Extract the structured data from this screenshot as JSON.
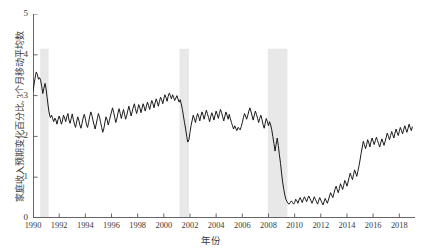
{
  "chart_data": {
    "type": "line",
    "title": "",
    "xlabel": "年份",
    "ylabel": "家庭收入预期变化百分比, 3个月移动平均数",
    "xlim": [
      1990.0,
      2019.2
    ],
    "ylim": [
      0,
      5
    ],
    "yticks": [
      0,
      1,
      2,
      3,
      4,
      5
    ],
    "xticks": [
      1990,
      1992,
      1994,
      1996,
      1998,
      2000,
      2002,
      2004,
      2006,
      2008,
      2010,
      2012,
      2014,
      2016,
      2018
    ],
    "xtick_labels": [
      "1990",
      "1992",
      "1994",
      "1996",
      "1998",
      "2000",
      "2002",
      "2004",
      "2006",
      "2008",
      "2010",
      "2012",
      "2014",
      "2016",
      "2018"
    ],
    "ytick_labels": [
      "0",
      "1",
      "2",
      "3",
      "4",
      "5"
    ],
    "grid": false,
    "legend": "none",
    "line_color": "#1a1a1a",
    "line_width": 1.0,
    "shading_color": "#e8e8e8",
    "axis_color": "#555555",
    "recession_bands": [
      {
        "name": "1990-1991 recession",
        "start": 1990.55,
        "end": 1991.2,
        "top": 4.15
      },
      {
        "name": "2001 recession",
        "start": 2001.2,
        "end": 2001.92,
        "top": 4.15
      },
      {
        "name": "2007-2009 recession",
        "start": 2007.95,
        "end": 2009.45,
        "top": 4.15
      }
    ],
    "series": [
      {
        "name": "家庭收入预期变化百分比(3个月移动平均)",
        "x": [
          1990.0,
          1990.08,
          1990.17,
          1990.25,
          1990.33,
          1990.42,
          1990.5,
          1990.58,
          1990.67,
          1990.75,
          1990.83,
          1990.92,
          1991.0,
          1991.08,
          1991.17,
          1991.25,
          1991.33,
          1991.42,
          1991.5,
          1991.58,
          1991.67,
          1991.75,
          1991.83,
          1991.92,
          1992.0,
          1992.08,
          1992.17,
          1992.25,
          1992.33,
          1992.42,
          1992.5,
          1992.58,
          1992.67,
          1992.75,
          1992.83,
          1992.92,
          1993.0,
          1993.08,
          1993.17,
          1993.25,
          1993.33,
          1993.42,
          1993.5,
          1993.58,
          1993.67,
          1993.75,
          1993.83,
          1993.92,
          1994.0,
          1994.08,
          1994.17,
          1994.25,
          1994.33,
          1994.42,
          1994.5,
          1994.58,
          1994.67,
          1994.75,
          1994.83,
          1994.92,
          1995.0,
          1995.08,
          1995.17,
          1995.25,
          1995.33,
          1995.42,
          1995.5,
          1995.58,
          1995.67,
          1995.75,
          1995.83,
          1995.92,
          1996.0,
          1996.08,
          1996.17,
          1996.25,
          1996.33,
          1996.42,
          1996.5,
          1996.58,
          1996.67,
          1996.75,
          1996.83,
          1996.92,
          1997.0,
          1997.08,
          1997.17,
          1997.25,
          1997.33,
          1997.42,
          1997.5,
          1997.58,
          1997.67,
          1997.75,
          1997.83,
          1997.92,
          1998.0,
          1998.08,
          1998.17,
          1998.25,
          1998.33,
          1998.42,
          1998.5,
          1998.58,
          1998.67,
          1998.75,
          1998.83,
          1998.92,
          1999.0,
          1999.08,
          1999.17,
          1999.25,
          1999.33,
          1999.42,
          1999.5,
          1999.58,
          1999.67,
          1999.75,
          1999.83,
          1999.92,
          2000.0,
          2000.08,
          2000.17,
          2000.25,
          2000.33,
          2000.42,
          2000.5,
          2000.58,
          2000.67,
          2000.75,
          2000.83,
          2000.92,
          2001.0,
          2001.08,
          2001.17,
          2001.25,
          2001.33,
          2001.42,
          2001.5,
          2001.58,
          2001.67,
          2001.75,
          2001.83,
          2001.92,
          2002.0,
          2002.08,
          2002.17,
          2002.25,
          2002.33,
          2002.42,
          2002.5,
          2002.58,
          2002.67,
          2002.75,
          2002.83,
          2002.92,
          2003.0,
          2003.08,
          2003.17,
          2003.25,
          2003.33,
          2003.42,
          2003.5,
          2003.58,
          2003.67,
          2003.75,
          2003.83,
          2003.92,
          2004.0,
          2004.08,
          2004.17,
          2004.25,
          2004.33,
          2004.42,
          2004.5,
          2004.58,
          2004.67,
          2004.75,
          2004.83,
          2004.92,
          2005.0,
          2005.08,
          2005.17,
          2005.25,
          2005.33,
          2005.42,
          2005.5,
          2005.58,
          2005.67,
          2005.75,
          2005.83,
          2005.92,
          2006.0,
          2006.08,
          2006.17,
          2006.25,
          2006.33,
          2006.42,
          2006.5,
          2006.58,
          2006.67,
          2006.75,
          2006.83,
          2006.92,
          2007.0,
          2007.08,
          2007.17,
          2007.25,
          2007.33,
          2007.42,
          2007.5,
          2007.58,
          2007.67,
          2007.75,
          2007.83,
          2007.92,
          2008.0,
          2008.08,
          2008.17,
          2008.25,
          2008.33,
          2008.42,
          2008.5,
          2008.58,
          2008.67,
          2008.75,
          2008.83,
          2008.92,
          2009.0,
          2009.08,
          2009.17,
          2009.25,
          2009.33,
          2009.42,
          2009.5,
          2009.58,
          2009.67,
          2009.75,
          2009.83,
          2009.92,
          2010.0,
          2010.08,
          2010.17,
          2010.25,
          2010.33,
          2010.42,
          2010.5,
          2010.58,
          2010.67,
          2010.75,
          2010.83,
          2010.92,
          2011.0,
          2011.08,
          2011.17,
          2011.25,
          2011.33,
          2011.42,
          2011.5,
          2011.58,
          2011.67,
          2011.75,
          2011.83,
          2011.92,
          2012.0,
          2012.08,
          2012.17,
          2012.25,
          2012.33,
          2012.42,
          2012.5,
          2012.58,
          2012.67,
          2012.75,
          2012.83,
          2012.92,
          2013.0,
          2013.08,
          2013.17,
          2013.25,
          2013.33,
          2013.42,
          2013.5,
          2013.58,
          2013.67,
          2013.75,
          2013.83,
          2013.92,
          2014.0,
          2014.08,
          2014.17,
          2014.25,
          2014.33,
          2014.42,
          2014.5,
          2014.58,
          2014.67,
          2014.75,
          2014.83,
          2014.92,
          2015.0,
          2015.08,
          2015.17,
          2015.25,
          2015.33,
          2015.42,
          2015.5,
          2015.58,
          2015.67,
          2015.75,
          2015.83,
          2015.92,
          2016.0,
          2016.08,
          2016.17,
          2016.25,
          2016.33,
          2016.42,
          2016.5,
          2016.58,
          2016.67,
          2016.75,
          2016.83,
          2016.92,
          2017.0,
          2017.08,
          2017.17,
          2017.25,
          2017.33,
          2017.42,
          2017.5,
          2017.58,
          2017.67,
          2017.75,
          2017.83,
          2017.92,
          2018.0,
          2018.08,
          2018.17,
          2018.25,
          2018.33,
          2018.42,
          2018.5,
          2018.58,
          2018.67,
          2018.75,
          2018.83,
          2018.92,
          2019.0
        ],
        "y": [
          3.1,
          3.28,
          3.45,
          3.58,
          3.52,
          3.4,
          3.44,
          3.38,
          3.22,
          3.05,
          3.18,
          3.3,
          3.16,
          2.95,
          2.72,
          2.55,
          2.46,
          2.52,
          2.44,
          2.36,
          2.45,
          2.4,
          2.3,
          2.42,
          2.5,
          2.42,
          2.3,
          2.38,
          2.52,
          2.45,
          2.36,
          2.48,
          2.56,
          2.4,
          2.32,
          2.44,
          2.55,
          2.42,
          2.3,
          2.22,
          2.35,
          2.48,
          2.4,
          2.28,
          2.2,
          2.32,
          2.45,
          2.54,
          2.44,
          2.3,
          2.22,
          2.34,
          2.48,
          2.6,
          2.52,
          2.4,
          2.28,
          2.18,
          2.3,
          2.44,
          2.56,
          2.48,
          2.34,
          2.22,
          2.1,
          2.2,
          2.35,
          2.48,
          2.4,
          2.28,
          2.38,
          2.5,
          2.6,
          2.7,
          2.58,
          2.46,
          2.34,
          2.45,
          2.58,
          2.68,
          2.56,
          2.44,
          2.55,
          2.66,
          2.54,
          2.42,
          2.52,
          2.64,
          2.74,
          2.62,
          2.5,
          2.6,
          2.72,
          2.8,
          2.68,
          2.56,
          2.66,
          2.78,
          2.7,
          2.58,
          2.68,
          2.8,
          2.72,
          2.62,
          2.74,
          2.84,
          2.76,
          2.66,
          2.78,
          2.88,
          2.8,
          2.7,
          2.82,
          2.92,
          2.84,
          2.74,
          2.86,
          2.96,
          2.9,
          2.8,
          2.92,
          3.02,
          2.95,
          2.86,
          2.98,
          3.06,
          3.0,
          2.92,
          3.02,
          2.96,
          2.88,
          2.94,
          3.0,
          2.92,
          2.84,
          2.9,
          2.8,
          2.66,
          2.5,
          2.34,
          2.18,
          2.0,
          1.86,
          1.92,
          2.1,
          2.26,
          2.4,
          2.52,
          2.44,
          2.34,
          2.46,
          2.56,
          2.48,
          2.38,
          2.5,
          2.6,
          2.52,
          2.42,
          2.54,
          2.64,
          2.56,
          2.46,
          2.36,
          2.48,
          2.58,
          2.5,
          2.4,
          2.52,
          2.62,
          2.54,
          2.44,
          2.56,
          2.66,
          2.58,
          2.48,
          2.38,
          2.5,
          2.6,
          2.52,
          2.42,
          2.54,
          2.44,
          2.34,
          2.26,
          2.18,
          2.26,
          2.2,
          2.14,
          2.22,
          2.2,
          2.16,
          2.24,
          2.34,
          2.46,
          2.56,
          2.5,
          2.42,
          2.52,
          2.62,
          2.7,
          2.6,
          2.5,
          2.4,
          2.52,
          2.62,
          2.54,
          2.44,
          2.34,
          2.44,
          2.52,
          2.42,
          2.3,
          2.2,
          2.32,
          2.44,
          2.36,
          2.26,
          2.36,
          2.28,
          2.16,
          2.0,
          1.82,
          1.64,
          1.8,
          1.96,
          1.78,
          1.56,
          1.34,
          1.1,
          0.88,
          0.7,
          0.56,
          0.46,
          0.4,
          0.36,
          0.34,
          0.38,
          0.42,
          0.38,
          0.34,
          0.38,
          0.46,
          0.42,
          0.36,
          0.44,
          0.5,
          0.44,
          0.38,
          0.46,
          0.52,
          0.46,
          0.4,
          0.48,
          0.54,
          0.48,
          0.42,
          0.36,
          0.44,
          0.52,
          0.46,
          0.4,
          0.34,
          0.42,
          0.5,
          0.44,
          0.38,
          0.32,
          0.4,
          0.48,
          0.42,
          0.36,
          0.44,
          0.54,
          0.62,
          0.56,
          0.5,
          0.6,
          0.7,
          0.78,
          0.7,
          0.62,
          0.72,
          0.84,
          0.78,
          0.7,
          0.8,
          0.92,
          0.86,
          0.78,
          0.88,
          1.0,
          1.1,
          1.02,
          0.94,
          1.06,
          1.18,
          1.1,
          1.02,
          1.14,
          1.28,
          1.42,
          1.58,
          1.74,
          1.88,
          1.8,
          1.7,
          1.8,
          1.92,
          1.84,
          1.74,
          1.86,
          1.96,
          1.88,
          1.8,
          1.9,
          1.98,
          1.9,
          1.82,
          1.74,
          1.84,
          1.94,
          1.86,
          1.78,
          1.88,
          1.98,
          2.08,
          2.0,
          1.92,
          2.02,
          2.12,
          2.04,
          1.96,
          2.08,
          2.18,
          2.1,
          2.02,
          2.12,
          2.22,
          2.14,
          2.06,
          2.16,
          2.26,
          2.18,
          2.1,
          2.2,
          2.3,
          2.22,
          2.14,
          2.24
        ]
      }
    ]
  }
}
